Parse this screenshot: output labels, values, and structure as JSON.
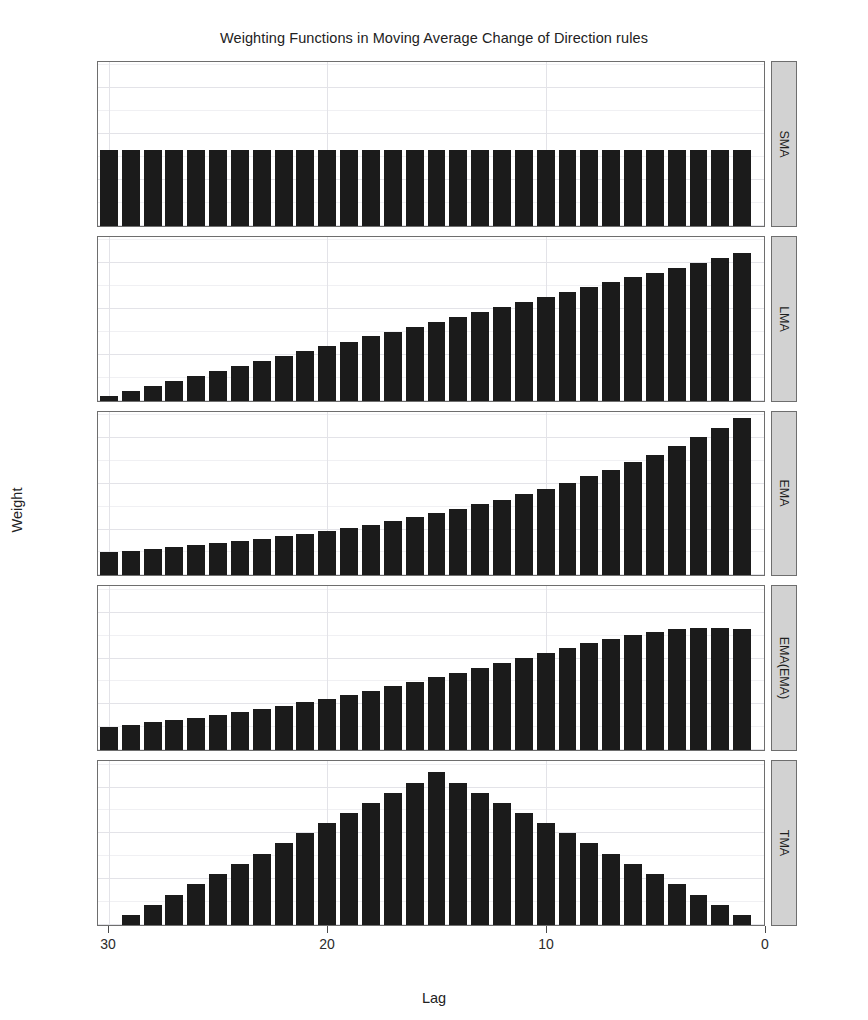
{
  "chart_data": {
    "type": "bar",
    "title": "Weighting Functions in Moving Average Change of Direction rules",
    "xlabel": "Lag",
    "ylabel": "Weight",
    "x_reversed": true,
    "xlim": [
      30.5,
      0
    ],
    "ylim": [
      0.0,
      0.0715
    ],
    "x_ticks": [
      30,
      20,
      10,
      0
    ],
    "y_ticks": [
      "0.00",
      "0.02",
      "0.04",
      "0.06"
    ],
    "y_tick_values": [
      0.0,
      0.02,
      0.04,
      0.06
    ],
    "grid": true,
    "legend": "none",
    "facet_position": "right-strip",
    "bar_color": "#1b1b1b",
    "lags": [
      30,
      29,
      28,
      27,
      26,
      25,
      24,
      23,
      22,
      21,
      20,
      19,
      18,
      17,
      16,
      15,
      14,
      13,
      12,
      11,
      10,
      9,
      8,
      7,
      6,
      5,
      4,
      3,
      2,
      1
    ],
    "series": [
      {
        "name": "SMA",
        "values": [
          0.0333,
          0.0333,
          0.0333,
          0.0333,
          0.0333,
          0.0333,
          0.0333,
          0.0333,
          0.0333,
          0.0333,
          0.0333,
          0.0333,
          0.0333,
          0.0333,
          0.0333,
          0.0333,
          0.0333,
          0.0333,
          0.0333,
          0.0333,
          0.0333,
          0.0333,
          0.0333,
          0.0333,
          0.0333,
          0.0333,
          0.0333,
          0.0333,
          0.0333,
          0.0333
        ]
      },
      {
        "name": "LMA",
        "values": [
          0.0022,
          0.0043,
          0.0065,
          0.0086,
          0.0108,
          0.0129,
          0.0151,
          0.0172,
          0.0194,
          0.0215,
          0.0237,
          0.0258,
          0.028,
          0.0301,
          0.0323,
          0.0344,
          0.0366,
          0.0387,
          0.0409,
          0.043,
          0.0452,
          0.0473,
          0.0495,
          0.0516,
          0.0538,
          0.0559,
          0.0581,
          0.0602,
          0.0624,
          0.0645
        ]
      },
      {
        "name": "EMA",
        "values": [
          0.01,
          0.0107,
          0.0114,
          0.0122,
          0.0131,
          0.014,
          0.0149,
          0.0159,
          0.017,
          0.0182,
          0.0194,
          0.0208,
          0.0222,
          0.0237,
          0.0254,
          0.0271,
          0.029,
          0.031,
          0.0331,
          0.0354,
          0.0378,
          0.0404,
          0.0432,
          0.0462,
          0.0493,
          0.0527,
          0.0564,
          0.0602,
          0.0644,
          0.0688
        ]
      },
      {
        "name": "EMA(EMA)",
        "values": [
          0.0102,
          0.0111,
          0.0121,
          0.0131,
          0.0142,
          0.0154,
          0.0166,
          0.018,
          0.0194,
          0.0209,
          0.0225,
          0.0242,
          0.026,
          0.0279,
          0.0298,
          0.0318,
          0.0339,
          0.036,
          0.0382,
          0.0404,
          0.0425,
          0.0446,
          0.0466,
          0.0485,
          0.0502,
          0.0516,
          0.0527,
          0.0534,
          0.0535,
          0.0528
        ]
      },
      {
        "name": "TMA",
        "values": [
          0.0,
          0.0044,
          0.0089,
          0.0133,
          0.0178,
          0.0222,
          0.0267,
          0.0311,
          0.0356,
          0.04,
          0.0444,
          0.0489,
          0.0533,
          0.0578,
          0.0622,
          0.0667,
          0.0622,
          0.0578,
          0.0533,
          0.0489,
          0.0444,
          0.04,
          0.0356,
          0.0311,
          0.0267,
          0.0222,
          0.0178,
          0.0133,
          0.0089,
          0.0044
        ]
      }
    ]
  },
  "panels": [
    {
      "strip_label": "SMA"
    },
    {
      "strip_label": "LMA"
    },
    {
      "strip_label": "EMA"
    },
    {
      "strip_label": "EMA(EMA)"
    },
    {
      "strip_label": "TMA"
    }
  ]
}
